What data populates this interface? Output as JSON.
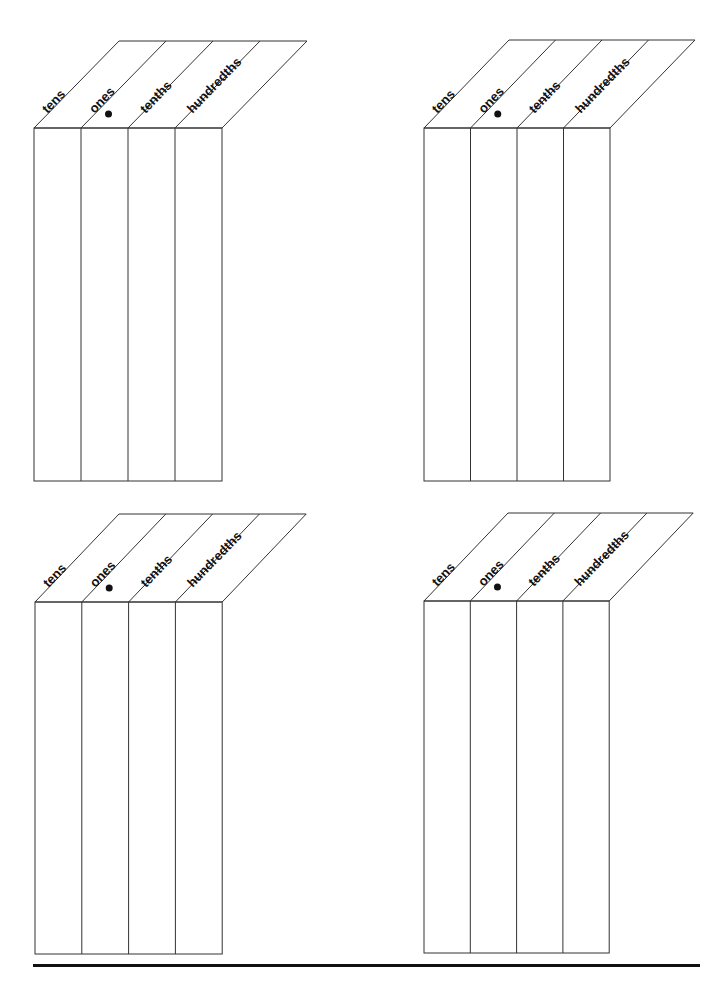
{
  "column_labels": [
    "tens",
    "ones",
    "tenths",
    "hundredths"
  ],
  "decimal_marker": "ones",
  "colors": {
    "line": "#333333",
    "text": "#111111",
    "background": "#ffffff"
  },
  "grids": [
    {
      "id": "top-left",
      "x": 34,
      "top": 128,
      "bottom": 481,
      "col_width": 47,
      "slant_dx": 85,
      "slant_dy": 87
    },
    {
      "id": "top-right",
      "x": 424,
      "top": 128,
      "bottom": 481,
      "col_width": 46.5,
      "slant_dx": 85,
      "slant_dy": 88
    },
    {
      "id": "bottom-left",
      "x": 35,
      "top": 602,
      "bottom": 954,
      "col_width": 46.8,
      "slant_dx": 84,
      "slant_dy": 88
    },
    {
      "id": "bottom-right",
      "x": 424,
      "top": 601,
      "bottom": 953,
      "col_width": 46.3,
      "slant_dx": 84,
      "slant_dy": 88
    }
  ],
  "footer": {
    "rule": true
  }
}
